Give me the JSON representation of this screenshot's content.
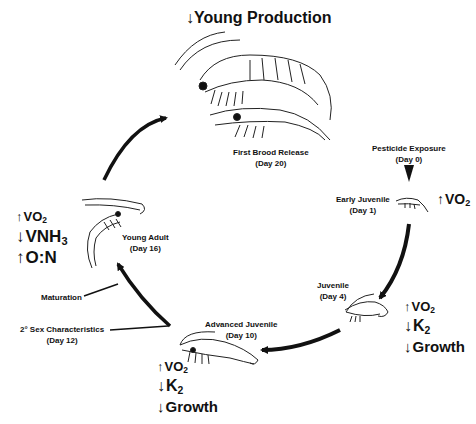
{
  "title": {
    "arrow": "↓",
    "text": "Young Production"
  },
  "stages": [
    {
      "name": "First Brood Release",
      "day": "(Day 20)"
    },
    {
      "name": "Pesticide Exposure",
      "day": "(Day 0)"
    },
    {
      "name": "Early Juvenile",
      "day": "(Day 1)"
    },
    {
      "name": "Juvenile",
      "day": "(Day 4)"
    },
    {
      "name": "Advanced Juvenile",
      "day": "(Day 10)"
    },
    {
      "name": "2° Sex Characteristics",
      "day": "(Day 12)"
    },
    {
      "name": "Maturation",
      "day": ""
    },
    {
      "name": "Young Adult",
      "day": "(Day 16)"
    }
  ],
  "effects": {
    "early_juvenile": [
      {
        "arrow": "↑",
        "text": "VO",
        "sub": "2"
      }
    ],
    "juvenile": [
      {
        "arrow": "↑",
        "text": "VO",
        "sub": "2"
      },
      {
        "arrow": "↓",
        "text": "K",
        "sub": "2"
      },
      {
        "arrow": "↓",
        "text": "Growth",
        "sub": ""
      }
    ],
    "advanced_juvenile": [
      {
        "arrow": "↑",
        "text": "VO",
        "sub": "2"
      },
      {
        "arrow": "↓",
        "text": "K",
        "sub": "2"
      },
      {
        "arrow": "↓",
        "text": "Growth",
        "sub": ""
      }
    ],
    "young_adult": [
      {
        "arrow": "↑",
        "text": "VO",
        "sub": "2"
      },
      {
        "arrow": "↓",
        "text": "VNH",
        "sub": "3"
      },
      {
        "arrow": "↑",
        "text": "O:N",
        "sub": ""
      }
    ]
  }
}
